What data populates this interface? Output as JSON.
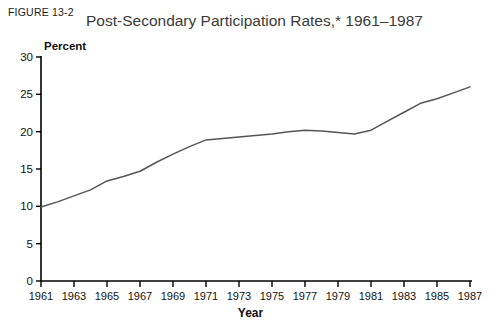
{
  "figure": {
    "label": "FIGURE 13-2"
  },
  "chart_data": {
    "type": "line",
    "title": "Post-Secondary Participation Rates,* 1961–1987",
    "xlabel": "Year",
    "ylabel": "Percent",
    "grid": false,
    "legend": "none",
    "line_color": "#555555",
    "axis_color": "#000000",
    "xlim": [
      1961,
      1987
    ],
    "ylim": [
      0,
      30
    ],
    "yticks": [
      0,
      5,
      10,
      15,
      20,
      25,
      30
    ],
    "ytick_labels": [
      "0",
      "5",
      "10",
      "15",
      "20",
      "25",
      "30"
    ],
    "xticks": [
      1961,
      1963,
      1965,
      1967,
      1969,
      1971,
      1973,
      1975,
      1977,
      1979,
      1981,
      1983,
      1985,
      1987
    ],
    "xtick_labels": [
      "1961",
      "1963",
      "1965",
      "1967",
      "1969",
      "1971",
      "1973",
      "1975",
      "1977",
      "1979",
      "1981",
      "1983",
      "1985",
      "1987"
    ],
    "series": [
      {
        "name": "Post-secondary participation rate",
        "x": [
          1961,
          1962,
          1963,
          1964,
          1965,
          1966,
          1967,
          1968,
          1969,
          1970,
          1971,
          1972,
          1973,
          1974,
          1975,
          1976,
          1977,
          1978,
          1979,
          1980,
          1981,
          1982,
          1983,
          1984,
          1985,
          1986,
          1987
        ],
        "values": [
          9.9,
          10.6,
          11.4,
          12.2,
          13.4,
          14.0,
          14.7,
          15.9,
          17.0,
          18.0,
          18.9,
          19.1,
          19.3,
          19.5,
          19.7,
          20.0,
          20.2,
          20.1,
          19.9,
          19.7,
          20.2,
          21.4,
          22.6,
          23.8,
          24.4,
          25.2,
          26.0
        ]
      }
    ]
  }
}
